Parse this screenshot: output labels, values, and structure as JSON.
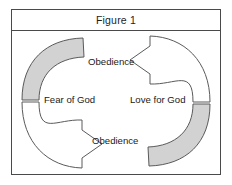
{
  "figure": {
    "caption": "Figure 1",
    "border_color": "#4a4a4a",
    "background": "#ffffff"
  },
  "diagram": {
    "type": "cycle-diagram",
    "arrow_fill_shaded": "#d2d2d2",
    "arrow_fill_plain": "#ffffff",
    "arrow_stroke": "#5a5a5a",
    "nodes": [
      {
        "id": "obedience-top",
        "label": "Obedience",
        "position": "top-center"
      },
      {
        "id": "fear-of-god",
        "label": "Fear of God",
        "position": "middle-left"
      },
      {
        "id": "love-for-god",
        "label": "Love for God",
        "position": "middle-right"
      },
      {
        "id": "obedience-bottom",
        "label": "Obedience",
        "position": "bottom-center"
      }
    ],
    "arrows": [
      {
        "id": "left-arrow",
        "from": "Fear of God",
        "through": "Obedience",
        "direction": "clockwise-down",
        "head": "points-right-at-bottom",
        "shaded_segment": "upper-arc"
      },
      {
        "id": "right-arrow",
        "from": "Love for God",
        "through": "Obedience",
        "direction": "counterclockwise-up",
        "head": "points-left-at-top",
        "shaded_segment": "lower-arc"
      }
    ]
  }
}
